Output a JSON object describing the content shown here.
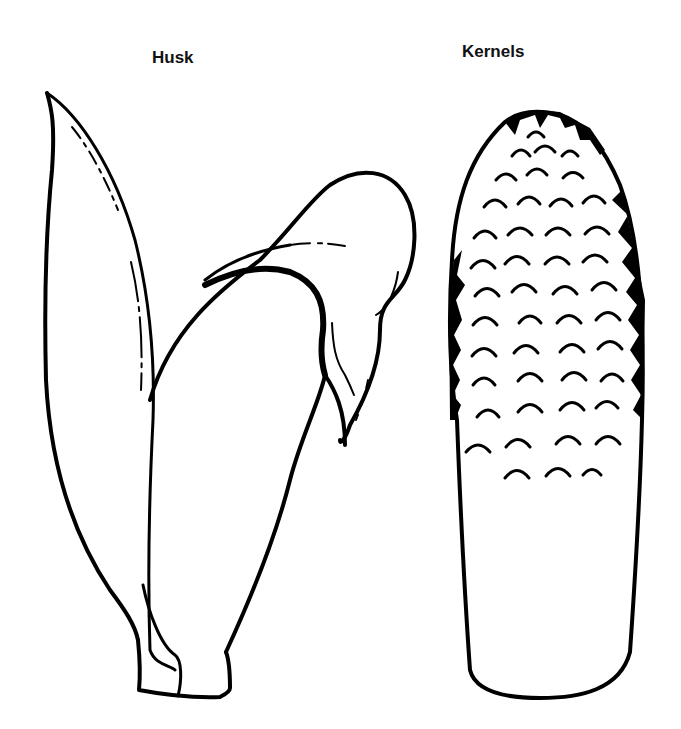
{
  "labels": {
    "husk": "Husk",
    "kernels": "Kernels"
  },
  "figures": [
    {
      "name": "husk",
      "description": "Line drawing of corn husk leaves"
    },
    {
      "name": "kernels",
      "description": "Line drawing of corn cob with kernels"
    }
  ],
  "colors": {
    "ink": "#000000",
    "background": "#ffffff"
  }
}
